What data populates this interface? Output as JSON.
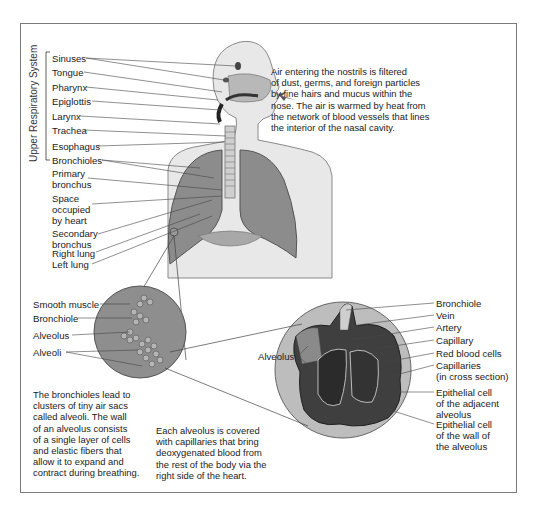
{
  "diagram": {
    "group_label": "Upper Respiratory System",
    "body_labels": [
      {
        "id": "sinuses",
        "text": "Sinuses"
      },
      {
        "id": "tongue",
        "text": "Tongue"
      },
      {
        "id": "pharynx",
        "text": "Pharynx"
      },
      {
        "id": "epiglottis",
        "text": "Epiglottis"
      },
      {
        "id": "larynx",
        "text": "Larynx"
      },
      {
        "id": "trachea",
        "text": "Trachea"
      },
      {
        "id": "esophagus",
        "text": "Esophagus"
      },
      {
        "id": "bronchioles",
        "text": "Bronchioles"
      },
      {
        "id": "primary_bronchus",
        "text": "Primary\nbronchus"
      },
      {
        "id": "heart_space",
        "text": "Space\noccupied\nby heart"
      },
      {
        "id": "secondary_bronchus",
        "text": "Secondary\nbronchus"
      },
      {
        "id": "right_lung",
        "text": "Right lung"
      },
      {
        "id": "left_lung",
        "text": "Left lung"
      }
    ],
    "nose_caption": "Air entering the nostrils is filtered\nof dust, germs, and foreign particles\nby fine hairs and mucus within the\nnose. The air is warmed by heat from\nthe network of blood vessels that lines\nthe interior of the nasal cavity.",
    "cluster_labels": [
      {
        "id": "smooth_muscle",
        "text": "Smooth muscle"
      },
      {
        "id": "bronchiole",
        "text": "Bronchiole"
      },
      {
        "id": "alveolus",
        "text": "Alveolus"
      },
      {
        "id": "alveoli",
        "text": "Alveoli"
      }
    ],
    "cluster_caption": "The bronchioles lead to\nclusters of tiny air sacs\ncalled alveoli. The wall\nof an alveolus consists\nof a single layer of cells\nand elastic fibers that\nallow it to expand and\ncontract during breathing.",
    "alveolus_caption": "Each alveolus is covered\nwith capillaries that bring\ndeoxygenated blood from\nthe rest of the body via the\nright side of the heart.",
    "detail_left_label": "Alveolus",
    "detail_labels": [
      {
        "id": "bronchiole",
        "text": "Bronchiole"
      },
      {
        "id": "vein",
        "text": "Vein"
      },
      {
        "id": "artery",
        "text": "Artery"
      },
      {
        "id": "capillary",
        "text": "Capillary"
      },
      {
        "id": "rbc",
        "text": "Red blood cells"
      },
      {
        "id": "capillaries_cs",
        "text": "Capillaries\n(in cross section)"
      },
      {
        "id": "epi_adjacent",
        "text": "Epithelial cell\nof the adjacent\nalveolus"
      },
      {
        "id": "epi_wall",
        "text": "Epithelial cell\nof the wall of\nthe alveolus"
      }
    ]
  }
}
